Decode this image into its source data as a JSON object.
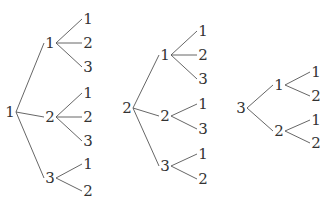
{
  "diagram": {
    "type": "tree",
    "trees": [
      {
        "root": {
          "label": "1",
          "x": 10,
          "y": 112
        },
        "children": [
          {
            "label": "1",
            "x": 50,
            "y": 43,
            "leaves": [
              {
                "label": "1",
                "x": 88,
                "y": 19
              },
              {
                "label": "2",
                "x": 88,
                "y": 43
              },
              {
                "label": "3",
                "x": 88,
                "y": 67
              }
            ]
          },
          {
            "label": "2",
            "x": 50,
            "y": 117,
            "leaves": [
              {
                "label": "1",
                "x": 88,
                "y": 93
              },
              {
                "label": "2",
                "x": 88,
                "y": 117
              },
              {
                "label": "3",
                "x": 88,
                "y": 141
              }
            ]
          },
          {
            "label": "3",
            "x": 50,
            "y": 178,
            "leaves": [
              {
                "label": "1",
                "x": 88,
                "y": 164
              },
              {
                "label": "2",
                "x": 88,
                "y": 191
              }
            ]
          }
        ]
      },
      {
        "root": {
          "label": "2",
          "x": 127,
          "y": 108
        },
        "children": [
          {
            "label": "1",
            "x": 165,
            "y": 55,
            "leaves": [
              {
                "label": "1",
                "x": 203,
                "y": 31
              },
              {
                "label": "2",
                "x": 203,
                "y": 55
              },
              {
                "label": "3",
                "x": 203,
                "y": 79
              }
            ]
          },
          {
            "label": "2",
            "x": 165,
            "y": 116,
            "leaves": [
              {
                "label": "1",
                "x": 203,
                "y": 104
              },
              {
                "label": "3",
                "x": 203,
                "y": 129
              }
            ]
          },
          {
            "label": "3",
            "x": 165,
            "y": 166,
            "leaves": [
              {
                "label": "1",
                "x": 203,
                "y": 154
              },
              {
                "label": "2",
                "x": 203,
                "y": 179
              }
            ]
          }
        ]
      },
      {
        "root": {
          "label": "3",
          "x": 241,
          "y": 108
        },
        "children": [
          {
            "label": "1",
            "x": 279,
            "y": 85,
            "leaves": [
              {
                "label": "1",
                "x": 316,
                "y": 72
              },
              {
                "label": "2",
                "x": 316,
                "y": 96
              }
            ]
          },
          {
            "label": "2",
            "x": 279,
            "y": 131,
            "leaves": [
              {
                "label": "1",
                "x": 316,
                "y": 120
              },
              {
                "label": "2",
                "x": 316,
                "y": 143
              }
            ]
          }
        ]
      }
    ]
  }
}
